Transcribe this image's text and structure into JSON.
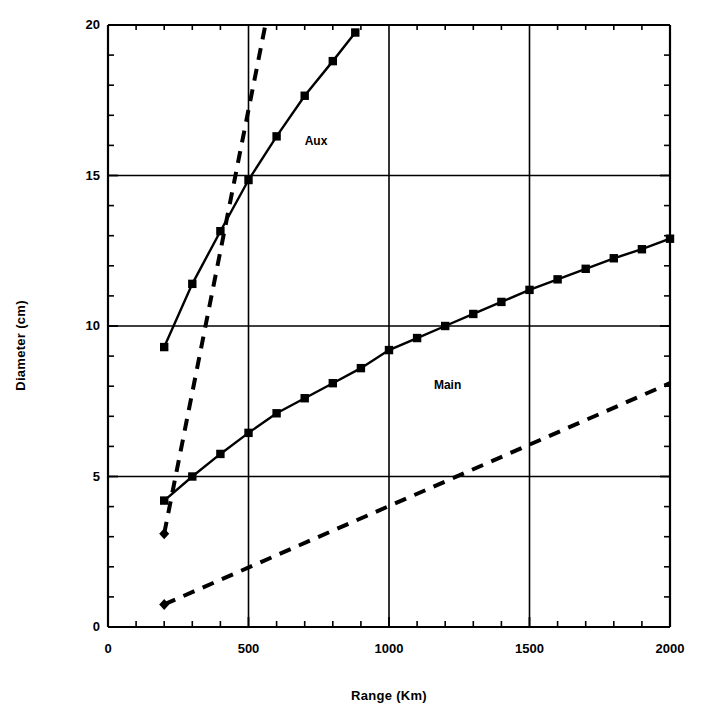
{
  "chart_data": {
    "type": "line",
    "title": "",
    "xlabel": "Range (Km)",
    "ylabel": "Diameter  (cm)",
    "xlim": [
      0,
      2000
    ],
    "ylim": [
      0,
      20
    ],
    "xticks": [
      0,
      500,
      1000,
      1500,
      2000
    ],
    "xtick_labels": [
      "0",
      "500",
      "1000",
      "1500",
      "2000"
    ],
    "yticks": [
      0,
      5,
      10,
      15,
      20
    ],
    "ytick_labels": [
      "0",
      "5",
      "10",
      "15",
      "20"
    ],
    "x_minor_tick_step": 100,
    "y_minor_tick_step": 1,
    "grid": true,
    "grid_style": "solid major gridlines at both axes major ticks",
    "legend": "none (inline curve annotations)",
    "annotations": [
      {
        "text": "Aux",
        "x": 700,
        "y": 16.1
      },
      {
        "text": "Main",
        "x": 1160,
        "y": 8.0
      }
    ],
    "series": [
      {
        "name": "Aux",
        "label": "Aux",
        "style": "solid",
        "marker": "filled-square",
        "color": "#000000",
        "points": [
          {
            "x": 200,
            "y": 9.3
          },
          {
            "x": 300,
            "y": 11.4
          },
          {
            "x": 400,
            "y": 13.15
          },
          {
            "x": 500,
            "y": 14.85
          },
          {
            "x": 600,
            "y": 16.3
          },
          {
            "x": 700,
            "y": 17.65
          },
          {
            "x": 800,
            "y": 18.8
          },
          {
            "x": 880,
            "y": 19.75
          }
        ]
      },
      {
        "name": "Main",
        "label": "Main",
        "style": "solid",
        "marker": "filled-square",
        "color": "#000000",
        "points": [
          {
            "x": 200,
            "y": 4.2
          },
          {
            "x": 300,
            "y": 5.0
          },
          {
            "x": 400,
            "y": 5.75
          },
          {
            "x": 500,
            "y": 6.45
          },
          {
            "x": 600,
            "y": 7.1
          },
          {
            "x": 700,
            "y": 7.6
          },
          {
            "x": 800,
            "y": 8.1
          },
          {
            "x": 900,
            "y": 8.6
          },
          {
            "x": 1000,
            "y": 9.2
          },
          {
            "x": 1100,
            "y": 9.6
          },
          {
            "x": 1200,
            "y": 10.0
          },
          {
            "x": 1300,
            "y": 10.4
          },
          {
            "x": 1400,
            "y": 10.8
          },
          {
            "x": 1500,
            "y": 11.2
          },
          {
            "x": 1600,
            "y": 11.55
          },
          {
            "x": 1700,
            "y": 11.9
          },
          {
            "x": 1800,
            "y": 12.25
          },
          {
            "x": 1900,
            "y": 12.55
          },
          {
            "x": 2000,
            "y": 12.9
          }
        ]
      },
      {
        "name": "Aux-dashed",
        "label": "",
        "style": "dashed",
        "marker": "filled-diamond-start",
        "color": "#000000",
        "points": [
          {
            "x": 200,
            "y": 3.1
          },
          {
            "x": 560,
            "y": 20.0
          }
        ]
      },
      {
        "name": "Main-dashed",
        "label": "",
        "style": "dashed",
        "marker": "filled-diamond-start",
        "color": "#000000",
        "points": [
          {
            "x": 200,
            "y": 0.75
          },
          {
            "x": 2000,
            "y": 8.1
          }
        ]
      }
    ]
  },
  "figure": {
    "background": "#ffffff",
    "foreground": "#000000",
    "plot_left_px": 108,
    "plot_right_px": 670,
    "plot_top_px": 25,
    "plot_bottom_px": 627
  }
}
